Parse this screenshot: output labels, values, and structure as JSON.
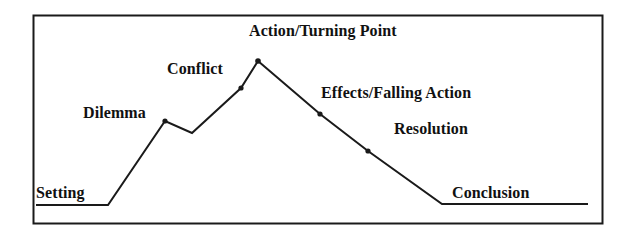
{
  "figure": {
    "type": "plot-diagram",
    "border_color": "#1a1a1a",
    "line_color": "#1a1a1a",
    "background_color": "#ffffff",
    "text_color": "#111111"
  },
  "labels": {
    "setting": "Setting",
    "dilemma": "Dilemma",
    "conflict": "Conflict",
    "action_turning_point": "Action/Turning Point",
    "effects_falling_action": "Effects/Falling Action",
    "resolution": "Resolution",
    "conclusion": "Conclusion"
  },
  "chart_data": {
    "type": "line",
    "xlabel": "",
    "ylabel": "",
    "xlim": [
      33,
      603
    ],
    "ylim": [
      224,
      15
    ],
    "grid": false,
    "legend": null,
    "series": [
      {
        "name": "plot-line",
        "points": [
          {
            "x": 36,
            "y": 205,
            "label": "Setting",
            "marker": false
          },
          {
            "x": 108,
            "y": 205,
            "label": "",
            "marker": false
          },
          {
            "x": 165,
            "y": 121,
            "label": "Dilemma",
            "marker": true
          },
          {
            "x": 192,
            "y": 133,
            "label": "",
            "marker": false
          },
          {
            "x": 241,
            "y": 88,
            "label": "Conflict",
            "marker": true
          },
          {
            "x": 258,
            "y": 61,
            "label": "Action/Turning Point",
            "marker": true
          },
          {
            "x": 320,
            "y": 114,
            "label": "Effects/Falling Action",
            "marker": true
          },
          {
            "x": 368,
            "y": 151,
            "label": "Resolution",
            "marker": true
          },
          {
            "x": 442,
            "y": 204,
            "label": "",
            "marker": false
          },
          {
            "x": 588,
            "y": 204,
            "label": "Conclusion",
            "marker": false
          }
        ]
      }
    ],
    "annotations": [
      {
        "text": "Setting",
        "x": 36,
        "y": 197
      },
      {
        "text": "Dilemma",
        "x": 83,
        "y": 118
      },
      {
        "text": "Conflict",
        "x": 167,
        "y": 74
      },
      {
        "text": "Action/Turning Point",
        "x": 249,
        "y": 36
      },
      {
        "text": "Effects/Falling Action",
        "x": 321,
        "y": 98
      },
      {
        "text": "Resolution",
        "x": 394,
        "y": 134
      },
      {
        "text": "Conclusion",
        "x": 452,
        "y": 197
      }
    ]
  }
}
